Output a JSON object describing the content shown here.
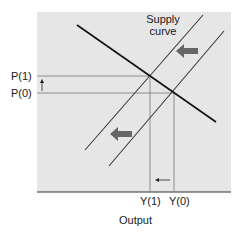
{
  "diagram": {
    "type": "supply-demand",
    "title": "",
    "supply_label_line1": "Supply",
    "supply_label_line2": "curve",
    "x_axis_label": "Output",
    "y_ticks": [
      "P(1)",
      "P(0)"
    ],
    "x_ticks": [
      "Y(1)",
      "Y(0)"
    ],
    "colors": {
      "background": "#e6e6e6",
      "lines": "#3a3a3a",
      "demand": "#111111",
      "arrow": "#666666"
    }
  }
}
